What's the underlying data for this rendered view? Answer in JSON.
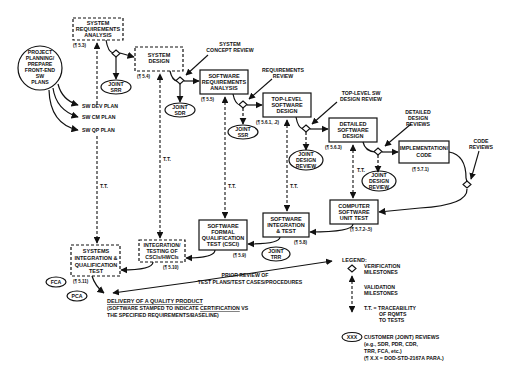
{
  "boxes": {
    "sys_req": {
      "lines": [
        "SYSTEM",
        "REQUIREMENTS",
        "ANALYSIS"
      ],
      "para": "(¶ 5.3)"
    },
    "sys_design": {
      "lines": [
        "SYSTEM",
        "DESIGN"
      ],
      "para": "(¶ 5.4)"
    },
    "sw_req": {
      "lines": [
        "SOFTWARE",
        "REQUIREMENTS",
        "ANALYSIS"
      ],
      "para": "(¶ 5.5)"
    },
    "top_level": {
      "lines": [
        "TOP-LEVEL",
        "SOFTWARE",
        "DESIGN"
      ],
      "para": "(¶ 5.6.1, .2)"
    },
    "detailed": {
      "lines": [
        "DETAILED",
        "SOFTWARE",
        "DESIGN"
      ],
      "para": "(¶ 5.6.3)"
    },
    "impl": {
      "lines": [
        "IMPLEMENTATION/",
        "CODE"
      ],
      "para": "(¶ 5.7.1)"
    },
    "unit_test": {
      "lines": [
        "COMPUTER",
        "SOFTWARE",
        "UNIT TEST"
      ],
      "para": "(¶ 5.7.2-.5)"
    },
    "sw_int": {
      "lines": [
        "SOFTWARE",
        "INTEGRATION",
        "& TEST"
      ],
      "para": "(¶ 5.8)"
    },
    "sw_fqt": {
      "lines": [
        "SOFTWARE",
        "FORMAL",
        "QUALIFICATION",
        "TEST (CSCI)"
      ],
      "para": "(¶ 5.9)"
    },
    "int_test": {
      "lines": [
        "INTEGRATION/",
        "TESTING OF",
        "CSCIs/HWCIs"
      ],
      "para": "(¶ 5.10)"
    },
    "sys_int": {
      "lines": [
        "SYSTEMS",
        "INTEGRATION &",
        "QUALIFICATION",
        "TEST"
      ],
      "para": "(¶ 5.11)"
    }
  },
  "planning": {
    "lines": [
      "PROJECT",
      "PLANNING/",
      "PREPARE",
      "FRONT-END",
      "SW",
      "PLANS"
    ]
  },
  "plans": [
    "SW DEV PLAN",
    "SW CM PLAN",
    "SW QP PLAN"
  ],
  "reviews": {
    "srr": [
      "JOINT",
      "SRR"
    ],
    "sdr": [
      "JOINT",
      "SDR"
    ],
    "ssr": [
      "JOINT",
      "SSR"
    ],
    "jdr1": [
      "JOINT",
      "DESIGN",
      "REVIEW"
    ],
    "jdr2": [
      "JOINT",
      "DESIGN",
      "REVIEW"
    ],
    "trr": [
      "JOINT",
      "TRR"
    ],
    "fca": "FCA",
    "pca": "PCA"
  },
  "callouts": {
    "sys_concept": [
      "SYSTEM",
      "CONCEPT REVIEW"
    ],
    "req_review": [
      "REQUIREMENTS",
      "REVIEW"
    ],
    "top_review": [
      "TOP-LEVEL SW",
      "DESIGN REVIEW"
    ],
    "detailed_reviews": [
      "DETAILED",
      "DESIGN",
      "REVIEWS"
    ],
    "code_reviews": [
      "CODE",
      "REVIEWS"
    ],
    "prior_review": [
      "PRIOR REVIEW OF",
      "TEST PLANS/TEST CASES/PROCEDURES"
    ]
  },
  "tt_label": "T.T.",
  "delivery": {
    "title": "DELIVERY OF A QUALITY PRODUCT",
    "line2_pre": "(SOFTWARE STAMPED TO INDICATE ",
    "line2_u": "CERTIFICATION",
    "line2_post": " VS",
    "line3": "THE SPECIFIED REQUIREMENTS/BASELINE)"
  },
  "legend": {
    "title": "LEGEND:",
    "verification": [
      "VERIFICATION",
      "MILESTONES"
    ],
    "validation": [
      "VALIDATION",
      "MILESTONES"
    ],
    "tt": [
      "T.T. = TRACEABILITY",
      "OF RQMTS",
      "TO TESTS"
    ],
    "xxx": "XXX",
    "customer": [
      "CUSTOMER (JOINT) REVIEWS",
      "(e.g., SDR, PDR, CDR,",
      "TRR, FCA, etc.)",
      "(¶ X.X = DOD-STD-2167A PARA.)"
    ]
  }
}
